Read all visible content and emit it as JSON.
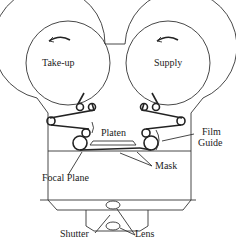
{
  "diagram": {
    "labels": {
      "takeup": "Take-up",
      "supply": "Supply",
      "platen": "Platen",
      "film_guide_1": "Film",
      "film_guide_2": "Guide",
      "mask": "Mask",
      "focal_plane": "Focal Plane",
      "shutter": "Shutter",
      "lens": "Lens"
    },
    "icons": {
      "takeup_rotation": "counterclockwise-arrow",
      "supply_rotation": "counterclockwise-arrow"
    },
    "colors": {
      "line": "#333333",
      "background": "#ffffff"
    }
  }
}
